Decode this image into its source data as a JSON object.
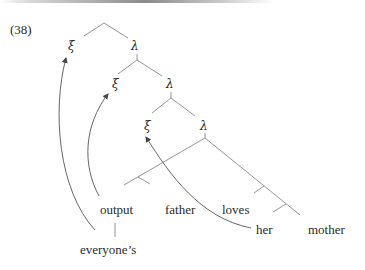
{
  "example_number": "(38)",
  "nodes": {
    "xi_1": "ξ",
    "lambda_1": "λ",
    "xi_2": "ξ",
    "lambda_2": "λ",
    "xi_3": "ξ",
    "lambda_3": "λ"
  },
  "leaves": {
    "output": "output",
    "father": "father",
    "loves": "loves",
    "her": "her",
    "mother": "mother",
    "everyones": "everyone’s"
  },
  "arrows": [
    {
      "from": "everyone’s",
      "to": "ξ (top)"
    },
    {
      "from": "output",
      "to": "ξ (middle)"
    },
    {
      "from": "her",
      "to": "ξ (lowest)"
    }
  ],
  "colors": {
    "edge": "#8a8a8a",
    "text": "#2a2a2a"
  }
}
